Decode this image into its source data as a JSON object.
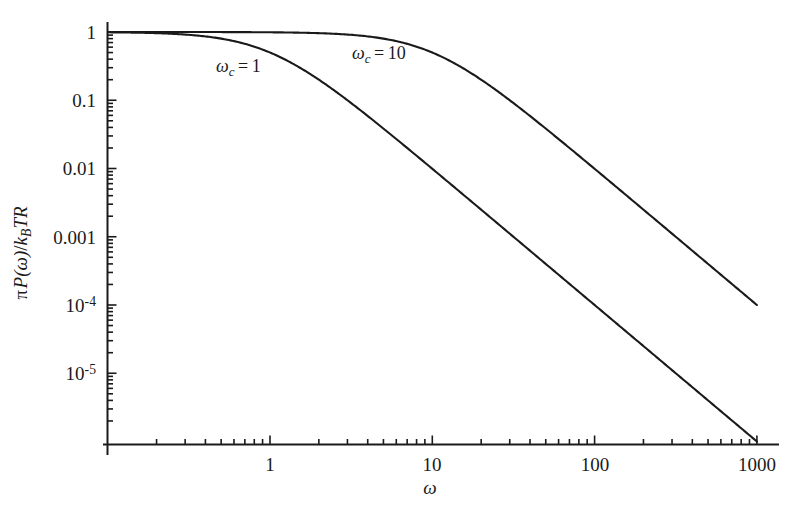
{
  "figure": {
    "background_color": "#ffffff",
    "line_color": "#1a1a1a",
    "width": 792,
    "height": 507
  },
  "axes": {
    "x": {
      "label": "ω",
      "scale": "log",
      "range": [
        0.04,
        1000
      ],
      "major_ticks": [
        1,
        10,
        100,
        1000
      ],
      "major_tick_labels": [
        "1",
        "10",
        "100",
        "1000"
      ]
    },
    "y": {
      "label_parts": {
        "pi": "π",
        "p_of_omega": "P(ω)",
        "slash": "/",
        "kb": "k",
        "kb_sub": "B",
        "t": "T",
        "r": "R"
      },
      "label_plain": "π P(ω)/k_B TR",
      "scale": "log",
      "range": [
        2e-06,
        1.3
      ],
      "major_ticks": [
        1,
        0.1,
        0.01,
        0.001,
        0.0001,
        1e-05
      ],
      "major_tick_labels": [
        "1",
        "0.1",
        "0.01",
        "0.001",
        "10⁻⁴",
        "10⁻⁵"
      ],
      "tick_label_exponents": [
        "",
        "",
        "",
        "",
        "-4",
        "-5"
      ]
    }
  },
  "annotations": [
    {
      "name": "omega-c-1-label",
      "symbol": "ω",
      "subscript": "c",
      "equals": "=",
      "value": "1",
      "text": "ωc = 1",
      "x": 216,
      "y": 57
    },
    {
      "name": "omega-c-10-label",
      "symbol": "ω",
      "subscript": "c",
      "equals": "=",
      "value": "10",
      "text": "ωc = 10",
      "x": 352,
      "y": 44
    }
  ],
  "chart_data": {
    "type": "line",
    "title": "",
    "xlabel": "ω",
    "ylabel": "π P(ω)/k_B TR",
    "xscale": "log",
    "yscale": "log",
    "xlim": [
      0.04,
      1000
    ],
    "ylim": [
      2e-06,
      1.3
    ],
    "grid": false,
    "legend": "inline-annotations",
    "formula": "pi P(omega)/(k_B T R) = 1/(1+(omega/omega_c)^2)",
    "series": [
      {
        "name": "ωc = 1",
        "omega_c": 1,
        "x": [
          0.04,
          0.06,
          0.1,
          0.15,
          0.2,
          0.3,
          0.4,
          0.5,
          0.7,
          1,
          1.5,
          2,
          3,
          5,
          7,
          10,
          15,
          20,
          30,
          50,
          70,
          100,
          150,
          200,
          300,
          500,
          700,
          1000
        ],
        "y": [
          0.9984,
          0.9964,
          0.9901,
          0.978,
          0.9615,
          0.9174,
          0.8621,
          0.8,
          0.6711,
          0.5,
          0.3077,
          0.2,
          0.1,
          0.03846,
          0.02,
          0.009901,
          0.004425,
          0.002494,
          0.001111,
          0.0003998,
          0.0002039,
          9.999e-05,
          4.444e-05,
          2.5e-05,
          1.111e-05,
          4e-06,
          2.04e-06,
          1e-06
        ]
      },
      {
        "name": "ωc = 10",
        "omega_c": 10,
        "x": [
          0.04,
          0.1,
          0.3,
          0.5,
          1,
          2,
          3,
          5,
          7,
          10,
          15,
          20,
          30,
          50,
          70,
          100,
          150,
          200,
          300,
          500,
          700,
          1000
        ],
        "y": [
          1.0,
          0.9999,
          0.9991,
          0.9975,
          0.9901,
          0.9615,
          0.9174,
          0.8,
          0.6711,
          0.5,
          0.3077,
          0.2,
          0.1,
          0.03846,
          0.02,
          0.009901,
          0.004425,
          0.002494,
          0.001111,
          0.0003998,
          0.0002039,
          9.999e-05
        ]
      }
    ],
    "endpoints": {
      "omega_c_1_end": {
        "x": 1000,
        "y": 1e-06
      },
      "omega_c_10_end": {
        "x": 1000,
        "y": 0.0001
      }
    }
  }
}
